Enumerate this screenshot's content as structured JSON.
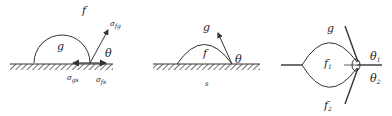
{
  "diagram": {
    "panels": [
      {
        "id": "panel-1",
        "description": "drop g on solid surface surrounded by phase f, with surface tensions",
        "labels": {
          "outer_phase": "f",
          "drop_phase": "g",
          "angle": "θ",
          "tension_fg": "σ",
          "tension_fg_sub": "fg",
          "tension_gs": "σ",
          "tension_gs_sub": "gs",
          "tension_fs": "σ",
          "tension_fs_sub": "fs"
        }
      },
      {
        "id": "panel-2",
        "description": "flattened drop f on solid s surrounded by phase g",
        "labels": {
          "outer_phase": "g",
          "drop_phase": "f",
          "angle": "θ",
          "solid": "s"
        }
      },
      {
        "id": "panel-3",
        "description": "lens of phase f1 at boundary between g and f2 with two contact angles",
        "labels": {
          "upper_phase": "g",
          "lens_phase": "f",
          "lens_phase_sub": "1",
          "lower_phase": "f",
          "lower_phase_sub": "2",
          "angle_1": "θ",
          "angle_1_sub": "1",
          "angle_2": "θ",
          "angle_2_sub": "2"
        }
      }
    ],
    "colors": {
      "stroke": "#333333",
      "text": "#222222",
      "background": "#ffffff"
    }
  }
}
